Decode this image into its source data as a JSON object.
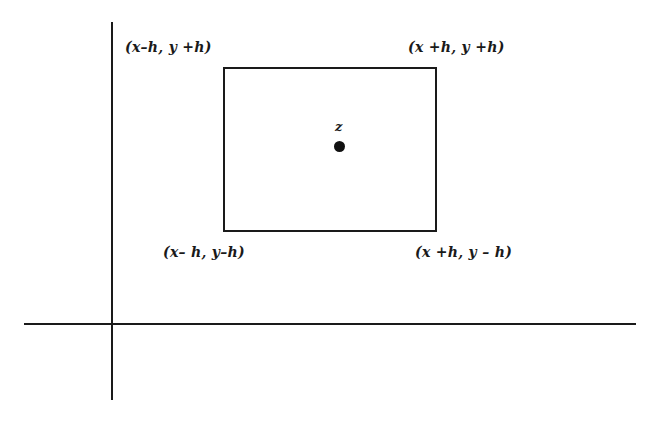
{
  "diagram": {
    "type": "square neighborhood of a point in the plane",
    "center_label": "z",
    "corners": {
      "top_left": "(x–h, y +h)",
      "top_right": "(x +h, y +h)",
      "bottom_left": "(x– h, y–h)",
      "bottom_right": "(x +h, y – h)"
    },
    "axes": {
      "horizontal": "x-axis",
      "vertical": "y-axis"
    },
    "colors": {
      "ink": "#1a1a1a",
      "background": "#ffffff"
    }
  }
}
